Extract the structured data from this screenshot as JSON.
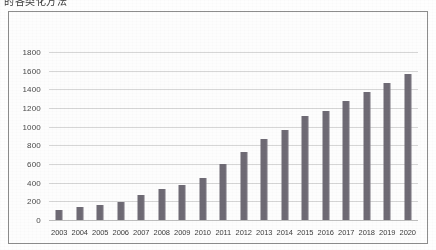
{
  "document": {
    "top_caption": "的各类化方法"
  },
  "chart": {
    "frame": true,
    "background_color": "#fdfdfd",
    "border_color": "#8d8d8d",
    "bar_color": "#6e6a74",
    "gridline_color": "#d6d6d6"
  },
  "chart_data": {
    "type": "bar",
    "title": "",
    "subtitle": "",
    "xlabel": "",
    "ylabel": "",
    "grid": true,
    "legend": false,
    "ylim": [
      0,
      1800
    ],
    "ytick_step": 200,
    "yticks": [
      0,
      200,
      400,
      600,
      800,
      1000,
      1200,
      1400,
      1600,
      1800
    ],
    "ytick_labels": [
      "0",
      "200",
      "400",
      "600",
      "800",
      "1000",
      "1200",
      "1400",
      "1600",
      "1800"
    ],
    "categories": [
      "2003",
      "2004",
      "2005",
      "2006",
      "2007",
      "2008",
      "2009",
      "2010",
      "2011",
      "2012",
      "2013",
      "2014",
      "2015",
      "2016",
      "2017",
      "2018",
      "2019",
      "2020"
    ],
    "values": [
      110,
      140,
      160,
      190,
      270,
      330,
      380,
      450,
      600,
      730,
      870,
      960,
      1110,
      1170,
      1270,
      1370,
      1470,
      1560
    ]
  }
}
